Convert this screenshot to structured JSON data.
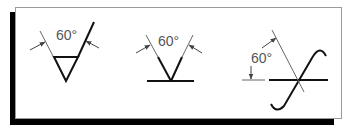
{
  "figure": {
    "colors": {
      "background": "#ffffff",
      "frame_border": "#9a9a9a",
      "frame_shadow": "#000000",
      "symbol_stroke": "#111111",
      "dimension_stroke": "#666666",
      "text": "#555555"
    },
    "symbols": [
      {
        "id": "single-v-groove-with-triangle",
        "angle_label": "60°"
      },
      {
        "id": "v-groove-on-reference-line",
        "angle_label": "60°"
      },
      {
        "id": "flare-crossing-symbol",
        "angle_label": "60°"
      }
    ]
  }
}
